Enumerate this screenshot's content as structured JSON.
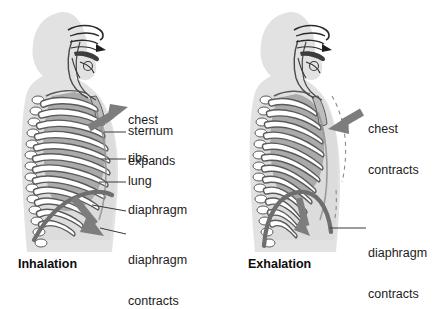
{
  "figure": {
    "background_color": "#ffffff",
    "body_fill": "#e2e2e2",
    "rib_fill": "#ffffff",
    "rib_stroke": "#5e5e5e",
    "lung_fill": "#a8a8a8",
    "diaphragm_color": "#6e6e6e",
    "arrow_color": "#7d7d7d",
    "leader_color": "#3a3a3a",
    "text_color": "#1c1c1c"
  },
  "panels": [
    {
      "id": "inhalation",
      "caption": "Inhalation",
      "arrows": [
        {
          "name": "chest-expands-arrow",
          "direction": "up-right",
          "label": "chest\nexpands"
        },
        {
          "name": "diaphragm-contracts-arrow",
          "direction": "down-right",
          "label": "diaphragm\ncontracts"
        }
      ],
      "labels": [
        {
          "id": "chest-expands",
          "line1": "chest",
          "line2": "expands",
          "x": 128,
          "y": 89,
          "leader": false
        },
        {
          "id": "sternum",
          "line1": "sternum",
          "line2": "",
          "x": 128,
          "y": 127,
          "leader": true
        },
        {
          "id": "ribs",
          "line1": "ribs",
          "line2": "",
          "x": 128,
          "y": 155,
          "leader": true
        },
        {
          "id": "lung",
          "line1": "lung",
          "line2": "",
          "x": 128,
          "y": 178,
          "leader": true
        },
        {
          "id": "diaphragm",
          "line1": "diaphragm",
          "line2": "",
          "x": 128,
          "y": 206,
          "leader": true
        },
        {
          "id": "diaphragm-contracts",
          "line1": "diaphragm",
          "line2": "contracts",
          "x": 128,
          "y": 229,
          "leader": true
        }
      ]
    },
    {
      "id": "exhalation",
      "caption": "Exhalation",
      "arrows": [
        {
          "name": "chest-contracts-arrow",
          "direction": "left",
          "label": "chest\ncontracts"
        },
        {
          "name": "diaphragm-contracts-arrow",
          "direction": "down",
          "label": "diaphragm\ncontracts"
        }
      ],
      "labels": [
        {
          "id": "chest-contracts",
          "line1": "chest",
          "line2": "contracts",
          "x": 368,
          "y": 98,
          "leader": false
        },
        {
          "id": "diaphragm-contracts",
          "line1": "diaphragm",
          "line2": "contracts",
          "x": 368,
          "y": 222,
          "leader": true
        }
      ]
    }
  ],
  "anatomy_parts": [
    "chest",
    "sternum",
    "ribs",
    "lung",
    "diaphragm",
    "head",
    "spine",
    "airway",
    "trachea"
  ]
}
